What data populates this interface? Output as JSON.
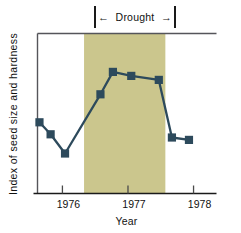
{
  "chart_data": {
    "type": "line",
    "title": "",
    "xlabel": "Year",
    "ylabel": "Index of seed size and hardness",
    "xlim": [
      1975.62,
      1978.35
    ],
    "ylim": [
      0,
      10
    ],
    "grid": false,
    "legend": "none",
    "x": [
      1975.65,
      1975.82,
      1976.04,
      1976.58,
      1976.77,
      1977.05,
      1977.47,
      1977.67,
      1977.93
    ],
    "values": [
      4.45,
      3.7,
      2.5,
      6.2,
      7.6,
      7.35,
      7.1,
      3.5,
      3.35
    ],
    "xticks": [
      1976,
      1977,
      1978
    ],
    "xticklabels": [
      "1976",
      "1977",
      "1978"
    ],
    "annotations": [
      {
        "label": "Drought",
        "type": "span-bracket",
        "x_start": 1976.33,
        "x_end": 1977.57,
        "arrow_left": "←",
        "arrow_right": "→"
      }
    ],
    "shaded_region": {
      "label": "Drought",
      "x_start": 1976.33,
      "x_end": 1977.57,
      "color": "#cbc68d"
    },
    "series_color": "#2d4a5c",
    "marker": "square"
  },
  "axes": {
    "frame_color": "#55555a",
    "background": "#ffffff"
  }
}
